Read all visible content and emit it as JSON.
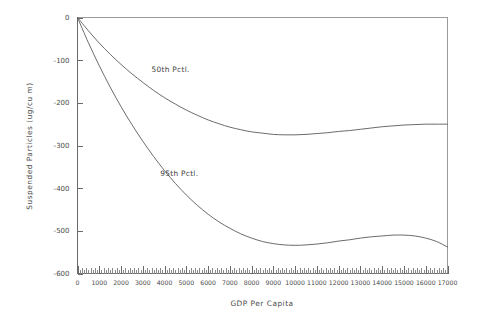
{
  "chart_data": {
    "type": "line",
    "title": "",
    "xlabel": "GDP Per Capita",
    "ylabel": "Suspended Particles (ug/cu m)",
    "xlim": [
      0,
      17000
    ],
    "ylim": [
      -600,
      0
    ],
    "grid": false,
    "legend_position": "inline-annotations",
    "xticks": [
      0,
      1000,
      2000,
      3000,
      4000,
      5000,
      6000,
      7000,
      8000,
      9000,
      10000,
      11000,
      12000,
      13000,
      14000,
      15000,
      16000,
      17000
    ],
    "xtick_labels": [
      "0",
      "1000",
      "2000",
      "3000",
      "4000",
      "5000",
      "6000",
      "7000",
      "8000",
      "9000",
      "10000",
      "11000",
      "12000",
      "13000",
      "14000",
      "15000",
      "16000",
      "17000"
    ],
    "yticks": [
      0,
      -100,
      -200,
      -300,
      -400,
      -500,
      -600
    ],
    "ytick_labels": [
      "0",
      "-100",
      "-200",
      "-300",
      "-400",
      "-500",
      "-600"
    ],
    "minor_xtick_interval": 200,
    "x": [
      0,
      500,
      1000,
      1500,
      2000,
      2500,
      3000,
      3500,
      4000,
      4500,
      5000,
      5500,
      6000,
      6500,
      7000,
      7500,
      8000,
      8500,
      9000,
      9500,
      10000,
      10500,
      11000,
      11500,
      12000,
      12500,
      13000,
      13500,
      14000,
      14500,
      15000,
      15500,
      16000,
      16500,
      17000
    ],
    "series": [
      {
        "name": "50th Pctl.",
        "label": "50th Pctl.",
        "color": "#5a5a5a",
        "annotation_x": 3400,
        "annotation_y": -128,
        "values": [
          0,
          -31,
          -60,
          -86,
          -110,
          -132,
          -152,
          -171,
          -188,
          -203,
          -217,
          -229,
          -240,
          -249,
          -257,
          -263,
          -268,
          -271,
          -274,
          -275,
          -275,
          -274,
          -272,
          -270,
          -267,
          -265,
          -262,
          -259,
          -256,
          -254,
          -252,
          -251,
          -250,
          -250,
          -250
        ]
      },
      {
        "name": "95th Pctl.",
        "label": "95th Pctl.",
        "color": "#5a5a5a",
        "annotation_x": 3800,
        "annotation_y": -372,
        "values": [
          0,
          -59,
          -113,
          -163,
          -209,
          -251,
          -290,
          -326,
          -359,
          -389,
          -416,
          -440,
          -461,
          -479,
          -494,
          -507,
          -517,
          -525,
          -530,
          -533,
          -534,
          -533,
          -531,
          -528,
          -524,
          -521,
          -517,
          -514,
          -512,
          -510,
          -510,
          -512,
          -517,
          -525,
          -538
        ]
      }
    ]
  },
  "axes": {
    "y_axis_title": "Suspended Particles (ug/cu m)",
    "x_axis_title": "GDP Per Capita"
  }
}
